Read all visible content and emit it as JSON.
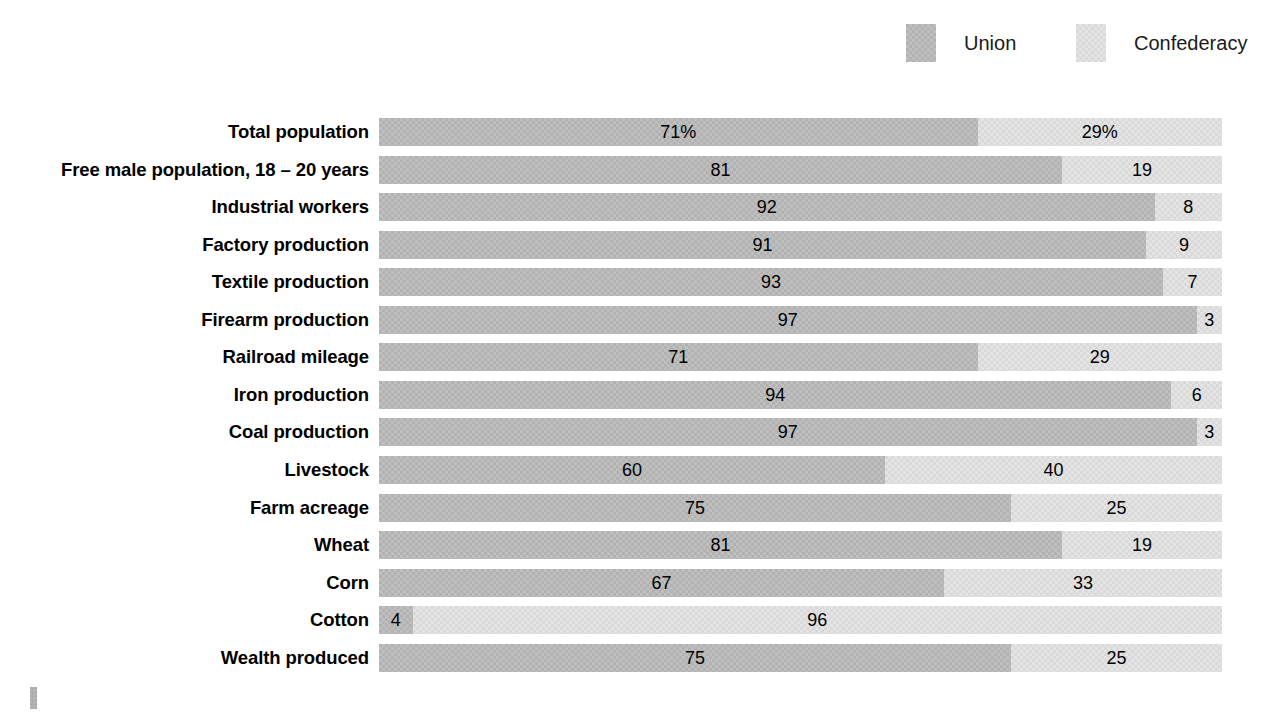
{
  "legend": {
    "entries": [
      {
        "label": "Union",
        "key": "union",
        "color": "#b2b2b2",
        "swatch_icon": "legend-swatch-icon"
      },
      {
        "label": "Confederacy",
        "key": "confederacy",
        "color": "#d9d9d9",
        "swatch_icon": "legend-swatch-icon"
      }
    ]
  },
  "chart_data": {
    "type": "bar",
    "subtype": "stacked-horizontal-100-percent",
    "title": "",
    "xlabel": "",
    "ylabel": "",
    "xlim": [
      0,
      100
    ],
    "grid": false,
    "legend_position": "top-right",
    "units": "percent",
    "categories": [
      "Total population",
      "Free male population, 18 – 20 years",
      "Industrial workers",
      "Factory production",
      "Textile production",
      "Firearm production",
      "Railroad mileage",
      "Iron production",
      "Coal production",
      "Livestock",
      "Farm acreage",
      "Wheat",
      "Corn",
      "Cotton",
      "Wealth produced"
    ],
    "series": [
      {
        "name": "Union",
        "color": "#b2b2b2",
        "values": [
          71,
          81,
          92,
          91,
          93,
          97,
          71,
          94,
          97,
          60,
          75,
          81,
          67,
          4,
          75
        ],
        "labels": [
          "71%",
          "81",
          "92",
          "91",
          "93",
          "97",
          "71",
          "94",
          "97",
          "60",
          "75",
          "81",
          "67",
          "4",
          "75"
        ]
      },
      {
        "name": "Confederacy",
        "color": "#d9d9d9",
        "values": [
          29,
          19,
          8,
          9,
          7,
          3,
          29,
          6,
          3,
          40,
          25,
          19,
          33,
          96,
          25
        ],
        "labels": [
          "29%",
          "19",
          "8",
          "9",
          "7",
          "3",
          "29",
          "6",
          "3",
          "40",
          "25",
          "19",
          "33",
          "96",
          "25"
        ]
      }
    ]
  },
  "rows": [
    {
      "label": "Total population",
      "union_value": 71,
      "union_label": "71%",
      "conf_value": 29,
      "conf_label": "29%"
    },
    {
      "label": "Free male population, 18 – 20 years",
      "union_value": 81,
      "union_label": "81",
      "conf_value": 19,
      "conf_label": "19"
    },
    {
      "label": "Industrial workers",
      "union_value": 92,
      "union_label": "92",
      "conf_value": 8,
      "conf_label": "8"
    },
    {
      "label": "Factory production",
      "union_value": 91,
      "union_label": "91",
      "conf_value": 9,
      "conf_label": "9"
    },
    {
      "label": "Textile production",
      "union_value": 93,
      "union_label": "93",
      "conf_value": 7,
      "conf_label": "7"
    },
    {
      "label": "Firearm production",
      "union_value": 97,
      "union_label": "97",
      "conf_value": 3,
      "conf_label": "3"
    },
    {
      "label": "Railroad mileage",
      "union_value": 71,
      "union_label": "71",
      "conf_value": 29,
      "conf_label": "29"
    },
    {
      "label": "Iron production",
      "union_value": 94,
      "union_label": "94",
      "conf_value": 6,
      "conf_label": "6"
    },
    {
      "label": "Coal production",
      "union_value": 97,
      "union_label": "97",
      "conf_value": 3,
      "conf_label": "3"
    },
    {
      "label": "Livestock",
      "union_value": 60,
      "union_label": "60",
      "conf_value": 40,
      "conf_label": "40"
    },
    {
      "label": "Farm acreage",
      "union_value": 75,
      "union_label": "75",
      "conf_value": 25,
      "conf_label": "25"
    },
    {
      "label": "Wheat",
      "union_value": 81,
      "union_label": "81",
      "conf_value": 19,
      "conf_label": "19"
    },
    {
      "label": "Corn",
      "union_value": 67,
      "union_label": "67",
      "conf_value": 33,
      "conf_label": "33"
    },
    {
      "label": "Cotton",
      "union_value": 4,
      "union_label": "4",
      "conf_value": 96,
      "conf_label": "96"
    },
    {
      "label": "Wealth produced",
      "union_value": 75,
      "union_label": "75",
      "conf_value": 25,
      "conf_label": "25"
    }
  ],
  "layout": {
    "first_row_top": 118,
    "row_pitch": 37.55,
    "bar_height": 28,
    "bar_left": 379,
    "bar_width": 843
  }
}
